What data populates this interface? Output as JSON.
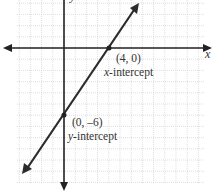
{
  "chart_data": {
    "type": "line",
    "title": "",
    "xlabel": "x",
    "ylabel": "y",
    "grid": true,
    "xlim": [
      -4.2,
      12.3
    ],
    "ylim": [
      -12,
      4.3
    ],
    "series": [
      {
        "name": "line through intercepts",
        "equation": "y = 1.5x - 6",
        "x": [
          -3.6,
          6.5
        ],
        "y": [
          -11.1,
          3.8
        ]
      }
    ],
    "points": [
      {
        "x": 4,
        "y": 0,
        "label": "(4, 0)",
        "annotation": "x-intercept"
      },
      {
        "x": 0,
        "y": -6,
        "label": "(0, –6)",
        "annotation": "y-intercept"
      }
    ],
    "annotations": [
      "(4, 0)",
      "x-intercept",
      "(0, –6)",
      "y-intercept"
    ]
  },
  "labels": {
    "x_axis": "x",
    "y_axis": "y",
    "x_int_point": "(4, 0)",
    "x_int_var": "x",
    "x_int_text": "-intercept",
    "y_int_point": "(0, –6)",
    "y_int_var": "y",
    "y_int_text": "-intercept"
  },
  "colors": {
    "line": "#2b2b2b",
    "grid": "#c8c8c8",
    "axis": "#222222"
  }
}
